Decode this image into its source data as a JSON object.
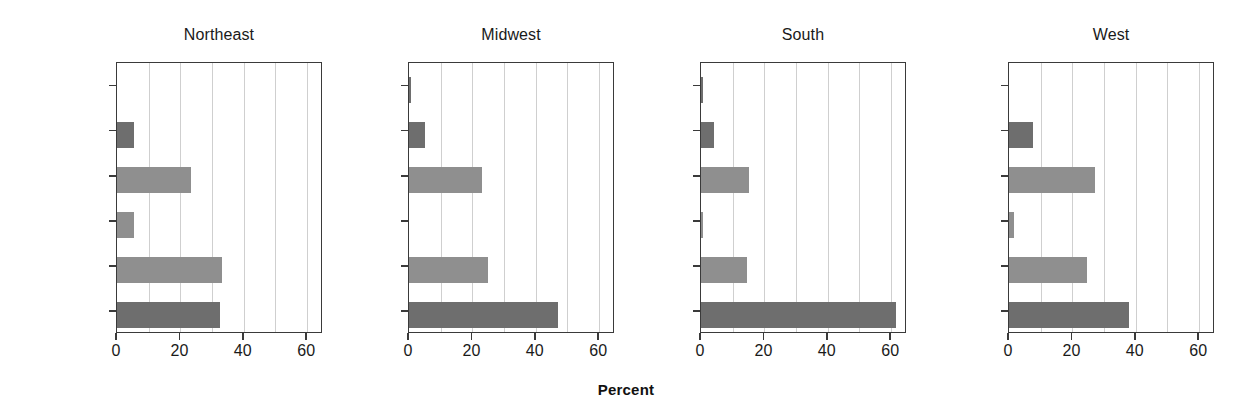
{
  "figure": {
    "xaxis_title": "Percent",
    "palette": {
      "bar_dark": "#6e6e6e",
      "bar_light": "#8f8f8f",
      "frame": "#3a3a3a",
      "grid": "#cfcfcf",
      "background": "#ffffff",
      "text": "#1a1a1a"
    }
  },
  "chart_data": {
    "type": "bar",
    "orientation": "horizontal",
    "title": "",
    "subtitle": "",
    "xlabel": "Percent",
    "ylabel": "",
    "xlim": [
      0,
      65
    ],
    "ylim": [
      0,
      6
    ],
    "xticks": [
      0,
      20,
      40,
      60
    ],
    "xtick_labels": [
      "0",
      "20",
      "40",
      "60"
    ],
    "gridlines_x": [
      10,
      20,
      30,
      40,
      50,
      60
    ],
    "grid": true,
    "legend": null,
    "legend_position": "none",
    "categories": [
      "Protestant",
      "Catholic",
      "Jewish",
      "None",
      "Other",
      "NA"
    ],
    "category_order_bottom_to_top": true,
    "panels": [
      {
        "label": "Northeast",
        "values": [
          32.5,
          33.0,
          5.5,
          23.5,
          5.5,
          0.0
        ]
      },
      {
        "label": "Midwest",
        "values": [
          47.0,
          25.0,
          0.0,
          23.0,
          5.0,
          0.5
        ]
      },
      {
        "label": "South",
        "values": [
          61.5,
          14.5,
          0.5,
          15.0,
          4.0,
          0.5
        ]
      },
      {
        "label": "West",
        "values": [
          38.0,
          24.5,
          1.5,
          27.0,
          7.5,
          0.0
        ]
      }
    ],
    "bar_colors_by_category": [
      "#6e6e6e",
      "#8f8f8f",
      "#8f8f8f",
      "#8f8f8f",
      "#6e6e6e",
      "#6e6e6e"
    ]
  }
}
